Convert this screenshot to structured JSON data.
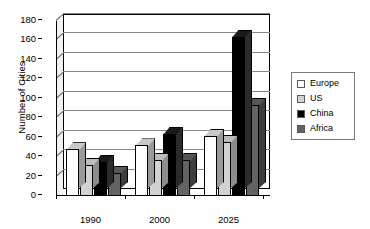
{
  "chart_data": {
    "type": "bar",
    "title": "",
    "xlabel": "",
    "ylabel": "Number of Cities",
    "categories": [
      "1990",
      "2000",
      "2025"
    ],
    "series": [
      {
        "name": "Europe",
        "color": "#ffffff",
        "values": [
          47,
          51,
          61
        ]
      },
      {
        "name": "US",
        "color": "#d2d2d2",
        "values": [
          31,
          36,
          55
        ]
      },
      {
        "name": "China",
        "color": "#000000",
        "values": [
          34,
          63,
          163
        ]
      },
      {
        "name": "Africa",
        "color": "#636363",
        "values": [
          23,
          36,
          93
        ]
      }
    ],
    "ylim": [
      0,
      180
    ],
    "yticks": [
      0,
      20,
      40,
      60,
      80,
      100,
      120,
      140,
      160,
      180
    ],
    "ytick_labels": [
      "0",
      "20",
      "40",
      "60",
      "80",
      "100",
      "120",
      "140",
      "160",
      "180"
    ],
    "grid": true,
    "legend_position": "right",
    "style": "3d-column"
  },
  "legend": {
    "items": [
      {
        "label": "Europe",
        "swatch": "#ffffff"
      },
      {
        "label": "US",
        "swatch": "#d2d2d2"
      },
      {
        "label": "China",
        "swatch": "#000000"
      },
      {
        "label": "Africa",
        "swatch": "#636363"
      }
    ]
  }
}
